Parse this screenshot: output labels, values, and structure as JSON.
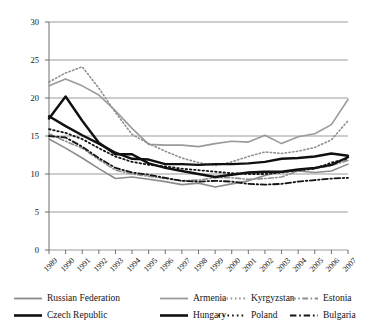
{
  "chart_data": {
    "type": "line",
    "title": "",
    "xlabel": "",
    "ylabel": "",
    "xlim": [
      1989,
      2007
    ],
    "ylim": [
      0,
      30
    ],
    "yticks": [
      0,
      5,
      10,
      15,
      20,
      25,
      30
    ],
    "grid": true,
    "legend_position": "bottom",
    "categories": [
      "1989",
      "1990",
      "1991",
      "1992",
      "1993",
      "1994",
      "1995",
      "1996",
      "1997",
      "1998",
      "1999",
      "2000",
      "2001",
      "2002",
      "2003",
      "2004",
      "2005",
      "2006",
      "2007"
    ],
    "series": [
      {
        "name": "Russian Federation",
        "color": "#8c8c8c",
        "style": "solid",
        "width": 1.6,
        "values": [
          14.6,
          13.4,
          12.1,
          10.7,
          9.4,
          9.6,
          9.3,
          9.0,
          8.6,
          8.8,
          8.3,
          8.7,
          9.1,
          9.8,
          10.3,
          10.4,
          10.2,
          10.4,
          11.3
        ]
      },
      {
        "name": "Armenia",
        "color": "#9a9a9a",
        "style": "solid",
        "width": 1.6,
        "values": [
          21.6,
          22.5,
          21.6,
          20.4,
          18.3,
          16.0,
          13.9,
          13.8,
          13.8,
          13.6,
          14.0,
          14.3,
          14.2,
          15.1,
          14.0,
          14.9,
          15.3,
          16.5,
          19.8
        ]
      },
      {
        "name": "Kyrgyzstan",
        "color": "#8f8f8f",
        "style": "dotted",
        "width": 1.6,
        "values": [
          22.1,
          23.3,
          24.1,
          21.3,
          18.1,
          15.2,
          14.0,
          13.0,
          12.1,
          11.5,
          11.1,
          11.6,
          12.3,
          12.9,
          12.7,
          13.0,
          13.5,
          14.5,
          17.0
        ]
      },
      {
        "name": "Estonia",
        "color": "#8f8f8f",
        "style": "dashdot",
        "width": 1.6,
        "values": [
          15.3,
          14.3,
          13.4,
          11.9,
          10.5,
          10.0,
          9.7,
          9.4,
          9.1,
          9.2,
          9.5,
          9.5,
          9.3,
          9.4,
          9.6,
          10.4,
          10.7,
          11.1,
          11.8
        ]
      },
      {
        "name": "Czech Republic",
        "color": "#101010",
        "style": "solid",
        "width": 2.4,
        "values": [
          17.3,
          20.2,
          17.0,
          14.1,
          12.6,
          12.6,
          11.4,
          10.8,
          10.4,
          10.0,
          9.6,
          9.9,
          10.2,
          10.3,
          10.3,
          10.6,
          10.8,
          11.2,
          12.2
        ]
      },
      {
        "name": "Hungary",
        "color": "#101010",
        "style": "solid",
        "width": 2.4,
        "values": [
          17.6,
          16.3,
          15.1,
          14.0,
          12.8,
          12.0,
          11.9,
          11.3,
          11.3,
          11.2,
          11.3,
          11.3,
          11.4,
          11.6,
          12.0,
          12.1,
          12.3,
          12.7,
          12.4
        ]
      },
      {
        "name": "Poland",
        "color": "#141414",
        "style": "dotted",
        "width": 1.8,
        "values": [
          15.9,
          15.4,
          14.6,
          13.4,
          12.3,
          11.6,
          11.2,
          11.0,
          10.7,
          10.5,
          10.3,
          10.1,
          10.0,
          10.0,
          10.2,
          10.5,
          10.7,
          11.5,
          12.0
        ]
      },
      {
        "name": "Bulgaria",
        "color": "#141414",
        "style": "dashdot",
        "width": 1.8,
        "values": [
          15.0,
          14.8,
          13.6,
          12.1,
          10.8,
          10.2,
          9.9,
          9.5,
          9.1,
          9.0,
          9.1,
          9.0,
          8.7,
          8.6,
          8.7,
          9.0,
          9.2,
          9.4,
          9.5
        ]
      }
    ]
  },
  "axis": {
    "ytick_labels": [
      "0",
      "5",
      "10",
      "15",
      "20",
      "25",
      "30"
    ],
    "xtick_labels": [
      "1989",
      "1990",
      "1991",
      "1992",
      "1993",
      "1994",
      "1995",
      "1996",
      "1997",
      "1998",
      "1999",
      "2000",
      "2001",
      "2002",
      "2003",
      "2004",
      "2005",
      "2006",
      "2007"
    ]
  },
  "legend": {
    "rows": [
      [
        {
          "label": "Russian Federation",
          "color": "#8c8c8c",
          "style": "solid",
          "width": 1.8
        },
        {
          "label": "Armenia",
          "color": "#9a9a9a",
          "style": "solid",
          "width": 1.8
        },
        {
          "label": "Kyrgyzstan",
          "color": "#8f8f8f",
          "style": "dotted",
          "width": 1.8
        },
        {
          "label": "Estonia",
          "color": "#8f8f8f",
          "style": "dashdot",
          "width": 1.8
        }
      ],
      [
        {
          "label": "Czech Republic",
          "color": "#101010",
          "style": "solid",
          "width": 2.6
        },
        {
          "label": "Hungary",
          "color": "#101010",
          "style": "solid",
          "width": 2.6
        },
        {
          "label": "Poland",
          "color": "#141414",
          "style": "dotted",
          "width": 2.0
        },
        {
          "label": "Bulgaria",
          "color": "#141414",
          "style": "dashdot",
          "width": 2.0
        }
      ]
    ]
  }
}
